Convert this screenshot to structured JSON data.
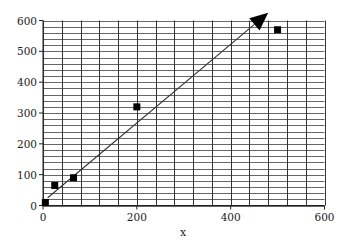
{
  "chart_data": {
    "type": "scatter",
    "title": "",
    "xlabel": "x",
    "ylabel": "",
    "xlim": [
      0,
      600
    ],
    "ylim": [
      0,
      600
    ],
    "x_ticks": [
      0,
      200,
      400,
      600
    ],
    "y_ticks": [
      0,
      100,
      200,
      300,
      400,
      500,
      600
    ],
    "x_tick_labels": [
      "0",
      "200",
      "400",
      "600"
    ],
    "y_tick_labels": [
      "0",
      "100",
      "200",
      "300",
      "400",
      "500",
      "600"
    ],
    "grid": {
      "on": true,
      "x_minor_step": 40,
      "y_minor_step": 20
    },
    "legend": null,
    "series": [
      {
        "name": "data",
        "marker": "square",
        "color": "#000000",
        "points": [
          {
            "x": 5,
            "y": 10
          },
          {
            "x": 25,
            "y": 65
          },
          {
            "x": 65,
            "y": 90
          },
          {
            "x": 200,
            "y": 320
          },
          {
            "x": 500,
            "y": 570
          }
        ]
      }
    ],
    "annotations": [
      {
        "type": "arrow",
        "from": {
          "x": 10,
          "y": 25
        },
        "to": {
          "x": 480,
          "y": 625
        },
        "color": "#333333"
      }
    ]
  }
}
